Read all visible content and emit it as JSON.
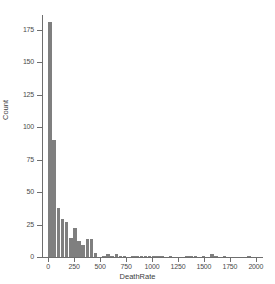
{
  "chart_data": {
    "type": "bar",
    "title": "",
    "subtitle": "",
    "xlabel": "DeathRate",
    "ylabel": "Count",
    "xlim": [
      -60,
      2060
    ],
    "ylim": [
      0,
      185
    ],
    "grid": false,
    "legend": "none",
    "bar_color": "#7f7f7f",
    "axis_color": "#6e6e6e",
    "bin_width": 40,
    "xticks": [
      0,
      250,
      500,
      750,
      1000,
      1250,
      1500,
      1750,
      2000
    ],
    "xtick_labels": [
      "0",
      "250",
      "500",
      "750",
      "1000",
      "1250",
      "1500",
      "1750",
      "2000"
    ],
    "yticks": [
      0,
      25,
      50,
      75,
      100,
      125,
      150,
      175
    ],
    "ytick_labels": [
      "0",
      "25",
      "50",
      "75",
      "100",
      "125",
      "150",
      "175"
    ],
    "categories": [
      20,
      60,
      100,
      140,
      180,
      220,
      260,
      300,
      340,
      380,
      420,
      460,
      500,
      540,
      580,
      620,
      660,
      700,
      740,
      780,
      820,
      860,
      900,
      940,
      980,
      1020,
      1060,
      1100,
      1140,
      1180,
      1220,
      1260,
      1300,
      1340,
      1380,
      1420,
      1460,
      1500,
      1540,
      1580,
      1620,
      1660,
      1700,
      1740,
      1780,
      1820,
      1860,
      1900,
      1940,
      1980
    ],
    "values": [
      181,
      90,
      38,
      29,
      27,
      15,
      22,
      12,
      9,
      14,
      14,
      3,
      0,
      1,
      2,
      1,
      2,
      1,
      1,
      0,
      1,
      1,
      1,
      1,
      1,
      1,
      1,
      1,
      0,
      1,
      0,
      0,
      0,
      1,
      1,
      1,
      0,
      1,
      0,
      2,
      1,
      0,
      1,
      0,
      0,
      0,
      0,
      0,
      1,
      0
    ]
  }
}
